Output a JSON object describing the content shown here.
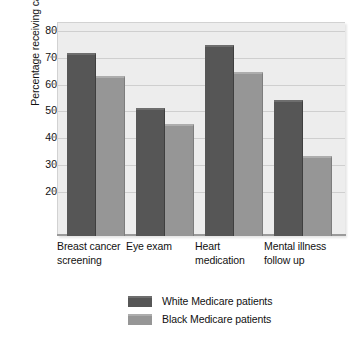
{
  "chart_data": {
    "type": "bar",
    "title": "",
    "xlabel": "",
    "ylabel": "Percentage receiving care",
    "ylim": [
      3,
      83
    ],
    "yticks": [
      20,
      30,
      40,
      50,
      60,
      70,
      80
    ],
    "ytick_labels": [
      "20",
      "30",
      "40",
      "50",
      "60",
      "70",
      "80"
    ],
    "grid": "horizontal",
    "legend_position": "bottom-center",
    "categories": [
      "Breast cancer\nscreening",
      "Eye exam",
      "Heart\nmedication",
      "Mental illness\nfollow up"
    ],
    "series": [
      {
        "name": "White Medicare patients",
        "color": "#565656",
        "values": [
          71.5,
          51,
          74.5,
          54
        ]
      },
      {
        "name": "Black Medicare patients",
        "color": "#969696",
        "values": [
          63,
          45,
          64.5,
          33
        ]
      }
    ]
  },
  "colors": {
    "plot_background": "#ededed",
    "gridline": "#cfcfcf",
    "axis": "#9a9a9a",
    "series_dark": "#565656",
    "series_light": "#969696",
    "text": "#111111",
    "page_background": "#ffffff"
  }
}
